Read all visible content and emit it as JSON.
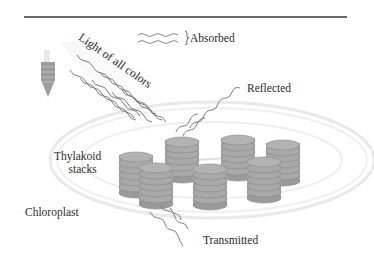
{
  "figure": {
    "type": "diagram",
    "labels": {
      "absorbed": "Absorbed",
      "light": "Light of all colors",
      "reflected": "Reflected",
      "thylakoid_line1": "Thylakoid",
      "thylakoid_line2": "stacks",
      "chloroplast": "Chloroplast",
      "transmitted": "Transmitted"
    },
    "icons": {
      "light_source": "light-bulb-icon",
      "absorbed_legend": "wavy-arrow-icon"
    },
    "thylakoid_stack_count": 7,
    "colors": {
      "stack_fill": "#a9a9a9",
      "stack_edge": "#7e7e7e",
      "membrane": "#e6e6e6",
      "wave": "#7a7a7a",
      "text": "#2b2b2b",
      "rule": "#3a3a3a"
    }
  }
}
